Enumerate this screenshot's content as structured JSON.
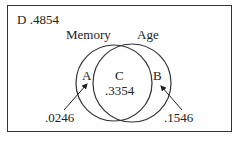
{
  "diagram": {
    "type": "venn",
    "outside_label": "D .4854",
    "sets": [
      {
        "name": "Memory"
      },
      {
        "name": "Age"
      }
    ],
    "regions": {
      "A": {
        "label": "A",
        "value": ".0246"
      },
      "B": {
        "label": "B",
        "value": ".1546"
      },
      "C": {
        "label": "C",
        "value": ".3354"
      }
    }
  }
}
